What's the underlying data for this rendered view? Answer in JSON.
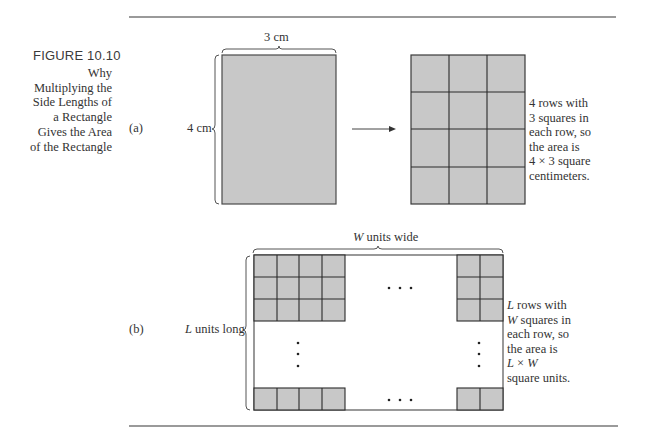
{
  "figure": {
    "number": "FIGURE 10.10",
    "caption_lines": [
      "Why",
      "Multiplying the",
      "Side Lengths of",
      "a Rectangle",
      "Gives the Area",
      "of the Rectangle"
    ]
  },
  "part_a": {
    "label": "(a)",
    "width_label": "3 cm",
    "height_label": "4 cm",
    "grid": {
      "rows": 4,
      "cols": 3
    },
    "note_lines": [
      "4 rows with",
      "3 squares in",
      "each row, so",
      "the area is",
      "4 × 3 square",
      "centimeters."
    ]
  },
  "part_b": {
    "label": "(b)",
    "width_label_var": "W",
    "width_label_rest": " units wide",
    "height_label_var": "L",
    "height_label_rest": " units long",
    "ellipsis_h": "· · ·",
    "note_lines": [
      {
        "var": "L",
        "rest": " rows with"
      },
      {
        "var": "W",
        "rest": " squares in"
      },
      {
        "var": "",
        "rest": "each row, so"
      },
      {
        "var": "",
        "rest": "the area is"
      },
      {
        "var": "L",
        "rest": " × ",
        "var2": "W"
      },
      {
        "var": "",
        "rest": "square units."
      }
    ]
  },
  "colors": {
    "fill": "#c8c8c8",
    "stroke": "#4a4a4a",
    "rule": "#9a9a9a",
    "text": "#333333"
  }
}
